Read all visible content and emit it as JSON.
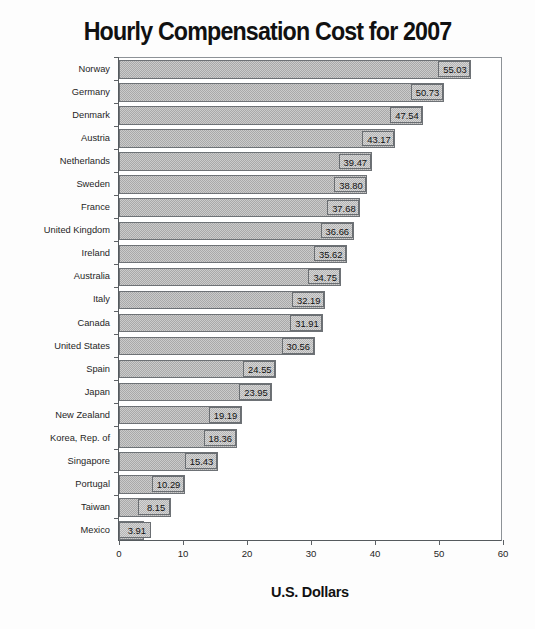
{
  "chart_data": {
    "type": "bar",
    "orientation": "horizontal",
    "title": "Hourly Compensation Cost for 2007",
    "xlabel": "U.S. Dollars",
    "ylabel": "",
    "xlim": [
      0,
      60
    ],
    "xticks": [
      "0",
      "10",
      "20",
      "30",
      "40",
      "50",
      "60"
    ],
    "grid": false,
    "legend": "none",
    "categories": [
      "Norway",
      "Germany",
      "Denmark",
      "Austria",
      "Netherlands",
      "Sweden",
      "France",
      "United Kingdom",
      "Ireland",
      "Australia",
      "Italy",
      "Canada",
      "United States",
      "Spain",
      "Japan",
      "New Zealand",
      "Korea, Rep. of",
      "Singapore",
      "Portugal",
      "Taiwan",
      "Mexico"
    ],
    "values": [
      55.03,
      50.73,
      47.54,
      43.17,
      39.47,
      38.8,
      37.68,
      36.66,
      35.62,
      34.75,
      32.19,
      31.91,
      30.56,
      24.55,
      23.95,
      19.19,
      18.36,
      15.43,
      10.29,
      8.15,
      3.91
    ],
    "value_labels": [
      "55.03",
      "50.73",
      "47.54",
      "43.17",
      "39.47",
      "38.80",
      "37.68",
      "36.66",
      "35.62",
      "34.75",
      "32.19",
      "31.91",
      "30.56",
      "24.55",
      "23.95",
      "19.19",
      "18.36",
      "15.43",
      "10.29",
      "8.15",
      "3.91"
    ],
    "colors": {
      "bar_fill": "#a9a9a9",
      "bar_border": "#6e7276",
      "axis": "#555a5e",
      "text": "#111111",
      "background": "#fdfdfd"
    }
  }
}
